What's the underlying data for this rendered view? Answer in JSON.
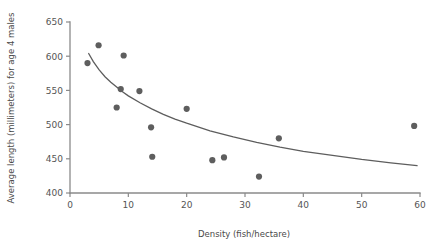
{
  "chart_data": {
    "type": "scatter",
    "title": "",
    "xlabel": "Density (fish/hectare)",
    "ylabel": "Average length (millimeters) for age 4 males",
    "xlim": [
      0,
      60
    ],
    "ylim": [
      400,
      650
    ],
    "xticks": [
      0,
      10,
      20,
      30,
      40,
      50,
      60
    ],
    "yticks": [
      400,
      450,
      500,
      550,
      600,
      650
    ],
    "xtick_labels": [
      "0",
      "10",
      "20",
      "30",
      "40",
      "50",
      "60"
    ],
    "ytick_labels": [
      "400",
      "450",
      "500",
      "550",
      "600",
      "650"
    ],
    "grid": false,
    "legend": false,
    "marker_color": "#5e5e5e",
    "curve_color": "#5d5d5d",
    "axis_color": "#8a8a8a",
    "points": [
      {
        "x": 3.0,
        "y": 590
      },
      {
        "x": 4.9,
        "y": 616
      },
      {
        "x": 8.0,
        "y": 525
      },
      {
        "x": 8.7,
        "y": 552
      },
      {
        "x": 9.2,
        "y": 601
      },
      {
        "x": 11.9,
        "y": 549
      },
      {
        "x": 13.9,
        "y": 496
      },
      {
        "x": 14.1,
        "y": 453
      },
      {
        "x": 20.0,
        "y": 523
      },
      {
        "x": 24.4,
        "y": 448
      },
      {
        "x": 26.4,
        "y": 452
      },
      {
        "x": 32.4,
        "y": 424
      },
      {
        "x": 35.8,
        "y": 480
      },
      {
        "x": 59.0,
        "y": 498
      }
    ],
    "fit_curve": {
      "description": "decreasing power/exponential trend line",
      "points": [
        {
          "x": 3.2,
          "y": 604
        },
        {
          "x": 4.0,
          "y": 592
        },
        {
          "x": 5.0,
          "y": 580
        },
        {
          "x": 6.0,
          "y": 570
        },
        {
          "x": 7.0,
          "y": 562
        },
        {
          "x": 8.0,
          "y": 555
        },
        {
          "x": 9.0,
          "y": 548
        },
        {
          "x": 10.0,
          "y": 542
        },
        {
          "x": 12.0,
          "y": 532
        },
        {
          "x": 14.0,
          "y": 523
        },
        {
          "x": 16.0,
          "y": 515
        },
        {
          "x": 18.0,
          "y": 508
        },
        {
          "x": 20.0,
          "y": 502
        },
        {
          "x": 24.0,
          "y": 491
        },
        {
          "x": 28.0,
          "y": 482
        },
        {
          "x": 32.0,
          "y": 474
        },
        {
          "x": 36.0,
          "y": 467
        },
        {
          "x": 40.0,
          "y": 461
        },
        {
          "x": 45.0,
          "y": 455
        },
        {
          "x": 50.0,
          "y": 449
        },
        {
          "x": 55.0,
          "y": 444
        },
        {
          "x": 59.5,
          "y": 440
        }
      ]
    }
  }
}
